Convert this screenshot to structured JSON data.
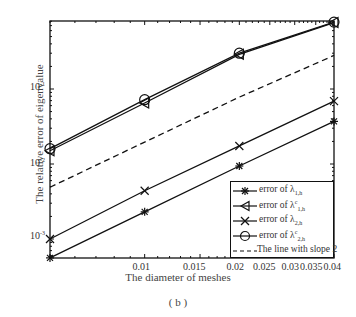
{
  "chart_data": {
    "type": "line",
    "title": "",
    "xlabel": "The diameter of meshes",
    "ylabel": "The relative error of eigenvalue",
    "xscale": "log",
    "yscale": "log",
    "x": [
      0.005,
      0.01,
      0.02,
      0.04
    ],
    "xlim": [
      0.005,
      0.04
    ],
    "ylim": [
      0.00056,
      0.8
    ],
    "xticks": [
      "0.01",
      "0.015",
      "0.02",
      "0.025",
      "0.03",
      "0.035",
      "0.04"
    ],
    "yticks": [
      "10^-3",
      "10^-2",
      "10^-1"
    ],
    "legend_position": "lower right",
    "grid": false,
    "series": [
      {
        "name": "error of λ1,h",
        "marker": "star",
        "style": "solid",
        "values": [
          0.00056,
          0.0023,
          0.0094,
          0.037
        ]
      },
      {
        "name": "error of λc1,h",
        "marker": "triangle-left",
        "style": "solid",
        "values": [
          0.015,
          0.065,
          0.29,
          0.77
        ]
      },
      {
        "name": "error of λ2,h",
        "marker": "x",
        "style": "solid",
        "values": [
          0.001,
          0.0044,
          0.0174,
          0.069
        ]
      },
      {
        "name": "error of λc2,h",
        "marker": "circle",
        "style": "solid",
        "values": [
          0.016,
          0.072,
          0.3,
          0.78
        ]
      },
      {
        "name": "The line with slope 2",
        "marker": "none",
        "style": "dashed",
        "values": [
          0.0049,
          0.0196,
          0.078,
          0.28
        ]
      }
    ]
  },
  "labels": {
    "xlabel": "The diameter of meshes",
    "ylabel": "The relative error of eigenvalue",
    "caption": "( b )",
    "xticks": [
      {
        "text": "0.01",
        "x": 143
      },
      {
        "text": "0.015",
        "x": 196
      },
      {
        "text": "0.02",
        "x": 237
      },
      {
        "text": "0.025",
        "x": 266
      },
      {
        "text": "0.03",
        "x": 292
      },
      {
        "text": "0.035",
        "x": 313
      },
      {
        "text": "0.04",
        "x": 334
      }
    ],
    "yticks": [
      {
        "base": "10",
        "exp": "-1",
        "y": 89
      },
      {
        "base": "10",
        "exp": "-2",
        "y": 165
      },
      {
        "base": "10",
        "exp": "-3",
        "y": 238
      }
    ],
    "legend": [
      {
        "prefix": "error of λ",
        "sup": "",
        "sub": "1,h"
      },
      {
        "prefix": "error of λ",
        "sup": "c",
        "sub": "1,h"
      },
      {
        "prefix": "error of λ",
        "sup": "",
        "sub": "2,h"
      },
      {
        "prefix": "error of λ",
        "sup": "c",
        "sub": "2,h"
      },
      {
        "prefix": "The line with slope 2",
        "sup": "",
        "sub": ""
      }
    ]
  }
}
